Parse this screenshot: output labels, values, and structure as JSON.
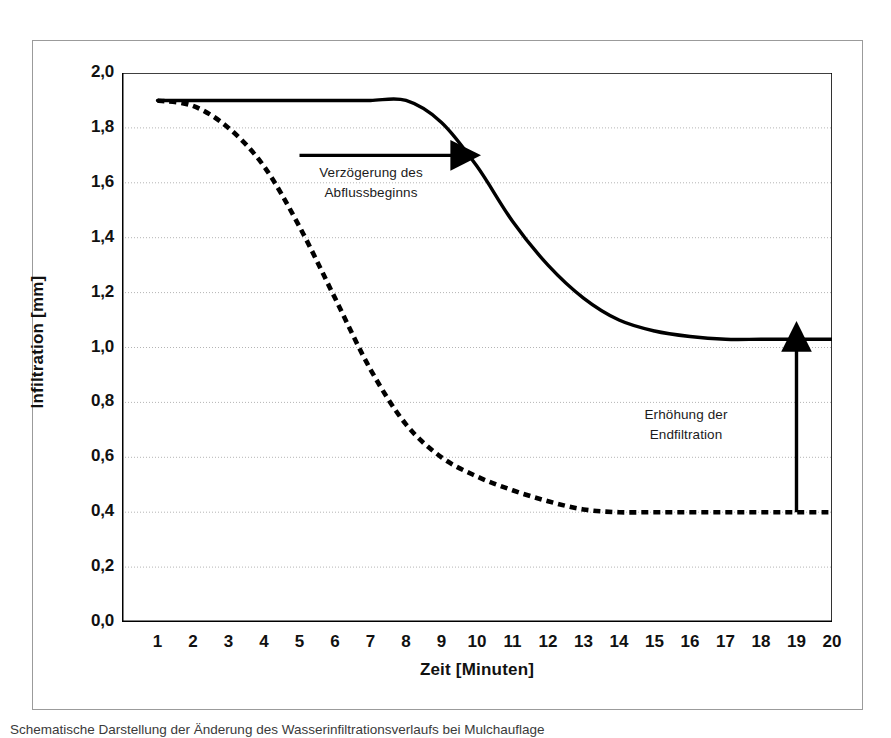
{
  "figure": {
    "caption": "Schematische Darstellung der Änderung des Wasserinfiltrationsverlaufs bei Mulchauflage"
  },
  "chart_data": {
    "type": "line",
    "title": "",
    "xlabel": "Zeit [Minuten]",
    "ylabel": "Infiltration [mm]",
    "xlim": [
      0,
      20
    ],
    "ylim": [
      0.0,
      2.0
    ],
    "grid": true,
    "legend_position": "none",
    "xticks": [
      1,
      2,
      3,
      4,
      5,
      6,
      7,
      8,
      9,
      10,
      11,
      12,
      13,
      14,
      15,
      16,
      17,
      18,
      19,
      20
    ],
    "xtick_labels": [
      "1",
      "2",
      "3",
      "4",
      "5",
      "6",
      "7",
      "8",
      "9",
      "10",
      "11",
      "12",
      "13",
      "14",
      "15",
      "16",
      "17",
      "18",
      "19",
      "20"
    ],
    "yticks": [
      0.0,
      0.2,
      0.4,
      0.6,
      0.8,
      1.0,
      1.2,
      1.4,
      1.6,
      1.8,
      2.0
    ],
    "ytick_labels": [
      "0,0",
      "0,2",
      "0,4",
      "0,6",
      "0,8",
      "1,0",
      "1,2",
      "1,4",
      "1,6",
      "1,8",
      "2,0"
    ],
    "x": [
      1,
      2,
      3,
      4,
      5,
      6,
      7,
      8,
      9,
      10,
      11,
      12,
      13,
      14,
      15,
      16,
      17,
      18,
      19,
      20
    ],
    "series": [
      {
        "name": "Infiltration mit Mulchauflage",
        "style": "solid",
        "color": "#000000",
        "values": [
          1.9,
          1.9,
          1.9,
          1.9,
          1.9,
          1.9,
          1.9,
          1.9,
          1.82,
          1.66,
          1.46,
          1.3,
          1.18,
          1.1,
          1.06,
          1.04,
          1.03,
          1.03,
          1.03,
          1.03
        ]
      },
      {
        "name": "Infiltration ohne Mulchauflage",
        "style": "dashed",
        "color": "#000000",
        "values": [
          1.9,
          1.88,
          1.8,
          1.66,
          1.44,
          1.18,
          0.92,
          0.72,
          0.6,
          0.53,
          0.48,
          0.44,
          0.41,
          0.4,
          0.4,
          0.4,
          0.4,
          0.4,
          0.4,
          0.4
        ]
      }
    ],
    "annotations": [
      {
        "name": "delay-annotation",
        "text": "Verzögerung des\nAbflussbeginns",
        "line1": "Verzögerung des",
        "line2": "Abflussbeginns",
        "arrow": "horizontal-right",
        "arrow_x_start": 5.0,
        "arrow_x_end": 9.6,
        "arrow_y": 1.7
      },
      {
        "name": "increase-annotation",
        "text": "Erhöhung der\nEndfiltration",
        "line1": "Erhöhung der",
        "line2": "Endfiltration",
        "arrow": "vertical-up",
        "arrow_x": 19.0,
        "arrow_y_start": 0.4,
        "arrow_y_end": 1.03
      }
    ]
  },
  "colors": {
    "curve": "#000000",
    "grid": "#b4b4b4",
    "axis": "#000000",
    "frame": "#9b9b9b",
    "background": "#ffffff"
  }
}
